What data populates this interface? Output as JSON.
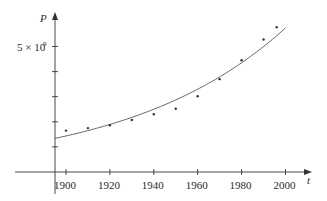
{
  "chart_data": {
    "type": "scatter",
    "title": "",
    "xlabel": "t",
    "ylabel": "P",
    "x_ticks": [
      1900,
      1920,
      1940,
      1960,
      1980,
      2000
    ],
    "y_ticks": [
      1000000000,
      2000000000,
      3000000000,
      4000000000,
      5000000000
    ],
    "y_tick_labels": [
      {
        "value": 5000000000,
        "text": "5 × 10",
        "sup": "9"
      }
    ],
    "xlim": [
      1877,
      2010
    ],
    "ylim": [
      0,
      6200000000
    ],
    "grid": false,
    "legend": null,
    "series": [
      {
        "name": "population data",
        "kind": "points",
        "x": [
          1900,
          1910,
          1920,
          1930,
          1940,
          1950,
          1960,
          1970,
          1980,
          1990,
          1996
        ],
        "y": [
          1650000000,
          1750000000,
          1860000000,
          2070000000,
          2300000000,
          2520000000,
          3020000000,
          3700000000,
          4450000000,
          5280000000,
          5770000000
        ]
      },
      {
        "name": "exponential model",
        "kind": "curve",
        "formula": "P = 1.4365e9 * 1.01395^(t-1900)",
        "a": 1436500000,
        "b": 1.01395,
        "t0": 1900,
        "x_range": [
          1895,
          2000
        ]
      }
    ]
  }
}
